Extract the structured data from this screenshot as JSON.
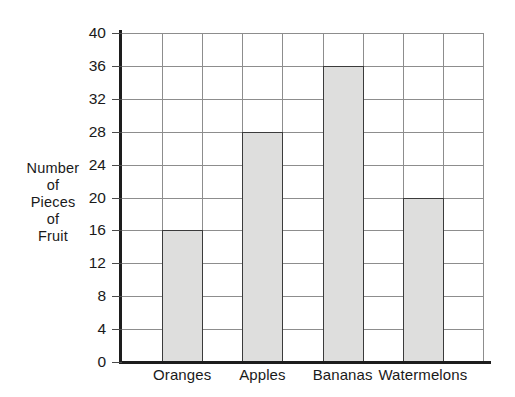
{
  "chart_data": {
    "type": "bar",
    "title": "",
    "subtitle": "",
    "xlabel": "",
    "ylabel": "Number\nof\nPieces\nof\nFruit",
    "categories": [
      "Oranges",
      "Apples",
      "Bananas",
      "Watermelons"
    ],
    "values": [
      16,
      28,
      36,
      20
    ],
    "ylim": [
      0,
      40
    ],
    "ytick_step": 4,
    "yticks": [
      0,
      4,
      8,
      12,
      16,
      20,
      24,
      28,
      32,
      36,
      40
    ],
    "ytick_labels": [
      "0",
      "4",
      "8",
      "12",
      "16",
      "20",
      "24",
      "28",
      "32",
      "36",
      "40"
    ],
    "grid": {
      "horizontal": true,
      "vertical": true,
      "vertical_columns": 9,
      "color": "#8d8d8d"
    },
    "legend": {
      "visible": false,
      "position": "none",
      "entries": []
    },
    "series": [
      {
        "name": "Number of Pieces of Fruit",
        "values": [
          16,
          28,
          36,
          20
        ],
        "bar_fill_color": "#dededd",
        "bar_border_color": "#3b3b3b"
      }
    ],
    "annotations": [],
    "background_color": "#ffffff",
    "axis_color": "#1d1d1d",
    "text_color": "#1a1a1a"
  }
}
